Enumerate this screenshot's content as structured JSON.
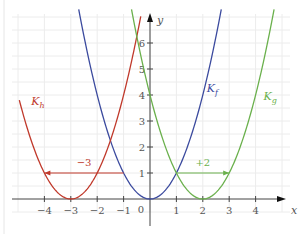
{
  "chart_data": {
    "type": "line",
    "title": "",
    "xlabel": "x",
    "ylabel": "y",
    "xlim": [
      -5.5,
      5.3
    ],
    "ylim": [
      -1.3,
      7.3
    ],
    "grid": true,
    "x_ticks": [
      -4,
      -3,
      -2,
      -1,
      1,
      2,
      3,
      4
    ],
    "x_tick_labels": [
      "−4",
      "−3",
      "−2",
      "−1",
      "1",
      "2",
      "3",
      "4"
    ],
    "y_ticks": [
      1,
      2,
      3,
      4,
      5,
      6
    ],
    "y_tick_labels": [
      "1",
      "2",
      "3",
      "4",
      "5",
      "6"
    ],
    "origin_label": "0",
    "series": [
      {
        "name": "K_f",
        "label_main": "K",
        "label_sub": "f",
        "formula": "x^2",
        "shift": 0,
        "color": "#3b4a9e",
        "x_range": [
          -2.7,
          2.7
        ],
        "label_at": [
          2.15,
          4.1
        ]
      },
      {
        "name": "K_h",
        "label_main": "K",
        "label_sub": "h",
        "formula": "(x+3)^2",
        "shift": -3,
        "color": "#c0392b",
        "x_range": [
          -4.95,
          -0.35
        ],
        "label_at": [
          -4.5,
          3.6
        ]
      },
      {
        "name": "K_g",
        "label_main": "K",
        "label_sub": "g",
        "formula": "(x-2)^2",
        "shift": 2,
        "color": "#6ab04c",
        "x_range": [
          -0.7,
          4.7
        ],
        "label_at": [
          4.3,
          3.8
        ]
      }
    ],
    "annotations": [
      {
        "type": "arrow",
        "from": [
          -1,
          1
        ],
        "to": [
          -4,
          1
        ],
        "label": "−3",
        "label_at": [
          -2.5,
          1.2
        ],
        "color": "#c0392b"
      },
      {
        "type": "arrow",
        "from": [
          1,
          1
        ],
        "to": [
          3,
          1
        ],
        "label": "+2",
        "label_at": [
          2,
          1.2
        ],
        "color": "#6ab04c"
      }
    ],
    "axis_color": "#444444",
    "grid_color": "#ececec"
  }
}
